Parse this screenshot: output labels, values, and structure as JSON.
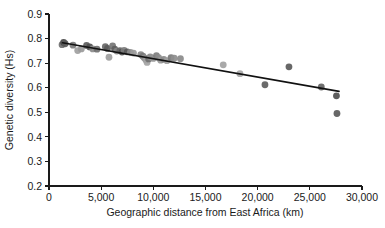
{
  "chart_data": {
    "type": "scatter",
    "title": "",
    "xlabel": "Geographic distance from East Africa (km)",
    "ylabel": "Genetic diversity (Hs)",
    "xlim": [
      0,
      30000
    ],
    "ylim": [
      0.2,
      0.9
    ],
    "xticks": [
      0,
      5000,
      10000,
      15000,
      20000,
      25000,
      30000
    ],
    "xticklabels": [
      "0",
      "5,000",
      "10,000",
      "15,000",
      "20,000",
      "25,000",
      "30,000"
    ],
    "yticks": [
      0.2,
      0.3,
      0.4,
      0.5,
      0.6,
      0.7,
      0.8,
      0.9
    ],
    "yticklabels": [
      "0.2",
      "0.3",
      "0.4",
      "0.5",
      "0.6",
      "0.7",
      "0.8",
      "0.9"
    ],
    "grid": false,
    "legend": "none",
    "point_colors": [
      "#4a4a4a",
      "#6e6e6e",
      "#8c8c8c",
      "#a6a6a6"
    ],
    "trend_line": {
      "name": "linear regression",
      "color": "#111111",
      "x_start": 1300,
      "y_start": 0.783,
      "x_end": 27800,
      "y_end": 0.585
    },
    "points": [
      {
        "x": 1250,
        "y": 0.775,
        "shade": "#6e6e6e",
        "r": 3.4
      },
      {
        "x": 1400,
        "y": 0.784,
        "shade": "#4a4a4a",
        "r": 3.4
      },
      {
        "x": 1550,
        "y": 0.779,
        "shade": "#5a5a5a",
        "r": 3.4
      },
      {
        "x": 2300,
        "y": 0.773,
        "shade": "#7a7a7a",
        "r": 3.4
      },
      {
        "x": 2750,
        "y": 0.751,
        "shade": "#a0a0a0",
        "r": 3.4
      },
      {
        "x": 3100,
        "y": 0.758,
        "shade": "#9a9a9a",
        "r": 3.4
      },
      {
        "x": 3600,
        "y": 0.772,
        "shade": "#5c5c5c",
        "r": 3.4
      },
      {
        "x": 3900,
        "y": 0.766,
        "shade": "#4f4f4f",
        "r": 3.4
      },
      {
        "x": 4200,
        "y": 0.758,
        "shade": "#8a8a8a",
        "r": 3.4
      },
      {
        "x": 4600,
        "y": 0.757,
        "shade": "#707070",
        "r": 3.4
      },
      {
        "x": 5400,
        "y": 0.767,
        "shade": "#686868",
        "r": 3.4
      },
      {
        "x": 5600,
        "y": 0.76,
        "shade": "#5a5a5a",
        "r": 3.4
      },
      {
        "x": 5750,
        "y": 0.724,
        "shade": "#9e9e9e",
        "r": 3.4
      },
      {
        "x": 6100,
        "y": 0.77,
        "shade": "#767676",
        "r": 3.4
      },
      {
        "x": 6300,
        "y": 0.757,
        "shade": "#5e5e5e",
        "r": 3.4
      },
      {
        "x": 6500,
        "y": 0.749,
        "shade": "#848484",
        "r": 3.4
      },
      {
        "x": 6800,
        "y": 0.751,
        "shade": "#666666",
        "r": 3.4
      },
      {
        "x": 7000,
        "y": 0.745,
        "shade": "#4f4f4f",
        "r": 3.4
      },
      {
        "x": 7200,
        "y": 0.752,
        "shade": "#7c7c7c",
        "r": 3.4
      },
      {
        "x": 7500,
        "y": 0.746,
        "shade": "#5a5a5a",
        "r": 3.4
      },
      {
        "x": 7800,
        "y": 0.744,
        "shade": "#8e8e8e",
        "r": 3.4
      },
      {
        "x": 8100,
        "y": 0.741,
        "shade": "#9a9a9a",
        "r": 3.4
      },
      {
        "x": 8800,
        "y": 0.735,
        "shade": "#888888",
        "r": 3.4
      },
      {
        "x": 9000,
        "y": 0.728,
        "shade": "#7a7a7a",
        "r": 3.4
      },
      {
        "x": 9150,
        "y": 0.721,
        "shade": "#8e8e8e",
        "r": 3.4
      },
      {
        "x": 9300,
        "y": 0.713,
        "shade": "#9c9c9c",
        "r": 3.4
      },
      {
        "x": 9400,
        "y": 0.703,
        "shade": "#a4a4a4",
        "r": 3.4
      },
      {
        "x": 9550,
        "y": 0.717,
        "shade": "#707070",
        "r": 3.4
      },
      {
        "x": 9700,
        "y": 0.725,
        "shade": "#8a8a8a",
        "r": 3.4
      },
      {
        "x": 10000,
        "y": 0.719,
        "shade": "#949494",
        "r": 3.4
      },
      {
        "x": 10300,
        "y": 0.731,
        "shade": "#7e7e7e",
        "r": 3.4
      },
      {
        "x": 10500,
        "y": 0.722,
        "shade": "#8c8c8c",
        "r": 3.4
      },
      {
        "x": 10700,
        "y": 0.712,
        "shade": "#989898",
        "r": 3.4
      },
      {
        "x": 11000,
        "y": 0.715,
        "shade": "#8a8a8a",
        "r": 3.4
      },
      {
        "x": 11300,
        "y": 0.71,
        "shade": "#9e9e9e",
        "r": 3.4
      },
      {
        "x": 11700,
        "y": 0.722,
        "shade": "#7a7a7a",
        "r": 3.4
      },
      {
        "x": 12000,
        "y": 0.72,
        "shade": "#8e8e8e",
        "r": 3.4
      },
      {
        "x": 12600,
        "y": 0.718,
        "shade": "#8a8a8a",
        "r": 3.4
      },
      {
        "x": 16700,
        "y": 0.693,
        "shade": "#a2a2a2",
        "r": 3.4
      },
      {
        "x": 18300,
        "y": 0.657,
        "shade": "#a8a8a8",
        "r": 3.4
      },
      {
        "x": 20700,
        "y": 0.612,
        "shade": "#5e5e5e",
        "r": 3.4
      },
      {
        "x": 23000,
        "y": 0.685,
        "shade": "#5a5a5a",
        "r": 3.4
      },
      {
        "x": 26100,
        "y": 0.603,
        "shade": "#646464",
        "r": 3.4
      },
      {
        "x": 27550,
        "y": 0.567,
        "shade": "#4f4f4f",
        "r": 3.4
      },
      {
        "x": 27600,
        "y": 0.495,
        "shade": "#5a5a5a",
        "r": 3.4
      }
    ]
  }
}
